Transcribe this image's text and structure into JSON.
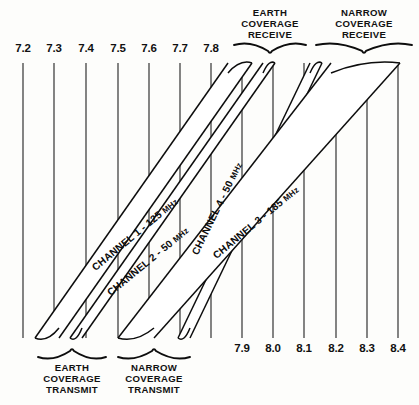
{
  "figure": {
    "type": "frequency-allocation-diagram"
  },
  "axes": {
    "top": {
      "name": "transmit-frequency-axis",
      "unit": "GHz",
      "ticks": [
        {
          "label": "7.2",
          "x": 23
        },
        {
          "label": "7.3",
          "x": 54
        },
        {
          "label": "7.4",
          "x": 86
        },
        {
          "label": "7.5",
          "x": 118
        },
        {
          "label": "7.6",
          "x": 149
        },
        {
          "label": "7.7",
          "x": 180
        },
        {
          "label": "7.8",
          "x": 211
        }
      ]
    },
    "bottom": {
      "name": "receive-frequency-axis",
      "unit": "GHz",
      "ticks": [
        {
          "label": "7.9",
          "x": 242
        },
        {
          "label": "8.0",
          "x": 273
        },
        {
          "label": "8.1",
          "x": 304
        },
        {
          "label": "8.2",
          "x": 336
        },
        {
          "label": "8.3",
          "x": 367
        },
        {
          "label": "8.4",
          "x": 398
        }
      ]
    }
  },
  "group_labels": {
    "top_left": {
      "name": "earth-coverage-receive",
      "lines": [
        "EARTH",
        "COVERAGE",
        "RECEIVE"
      ],
      "brace": {
        "x1": 234,
        "x2": 306,
        "y": 52
      }
    },
    "top_right": {
      "name": "narrow-coverage-receive",
      "lines": [
        "NARROW",
        "COVERAGE",
        "RECEIVE"
      ],
      "brace": {
        "x1": 316,
        "x2": 412,
        "y": 52
      }
    },
    "bottom_left": {
      "name": "earth-coverage-transmit",
      "lines": [
        "EARTH",
        "COVERAGE",
        "TRANSMIT"
      ],
      "brace": {
        "x1": 38,
        "x2": 106,
        "y": 350
      }
    },
    "bottom_right": {
      "name": "narrow-coverage-transmit",
      "lines": [
        "NARROW",
        "COVERAGE",
        "TRANSMIT"
      ],
      "brace": {
        "x1": 118,
        "x2": 190,
        "y": 350
      }
    }
  },
  "channels": [
    {
      "id": "channel-1",
      "label": "CHANNEL 1 - 125",
      "unit": "MHz",
      "number": 1,
      "bandwidth_mhz": 125,
      "label_x": 137,
      "label_y": 237,
      "label_angle": -39.5,
      "bottom_left_x": 35,
      "bottom_right_x": 59,
      "top_left_x": 228,
      "top_right_x": 252,
      "group_transmit": "EARTH COVERAGE TRANSMIT",
      "group_receive": "EARTH COVERAGE RECEIVE"
    },
    {
      "id": "channel-2",
      "label": "CHANNEL 2 - 50",
      "unit": "MHz",
      "number": 2,
      "bandwidth_mhz": 50,
      "label_x": 150,
      "label_y": 264,
      "label_angle": -39.5,
      "bottom_left_x": 70,
      "bottom_right_x": 82,
      "top_left_x": 263,
      "top_right_x": 275,
      "group_transmit": "EARTH COVERAGE TRANSMIT",
      "group_receive": "EARTH COVERAGE RECEIVE"
    },
    {
      "id": "channel-4",
      "label": "CHANNEL 4 - 50",
      "unit": "MHz",
      "number": 4,
      "bandwidth_mhz": 50,
      "label_x": 220,
      "label_y": 210,
      "label_angle": -64,
      "bottom_left_x": 178,
      "bottom_right_x": 190,
      "top_left_x": 310,
      "top_right_x": 322,
      "group_transmit": "NARROW COVERAGE TRANSMIT",
      "group_receive": "NARROW COVERAGE RECEIVE"
    },
    {
      "id": "channel-3",
      "label": "CHANNEL 3 - 185",
      "unit": "MHz",
      "number": 3,
      "bandwidth_mhz": 185,
      "label_x": 258,
      "label_y": 225,
      "label_angle": -39.5,
      "bottom_left_x": 118,
      "bottom_right_x": 154,
      "top_left_x": 331,
      "top_right_x": 400,
      "group_transmit": "NARROW COVERAGE TRANSMIT",
      "group_receive": "NARROW COVERAGE RECEIVE"
    }
  ],
  "colors": {
    "ink": "#0d0d0d",
    "grid": "#2a2a2a",
    "paper": "#fdfdfb"
  }
}
